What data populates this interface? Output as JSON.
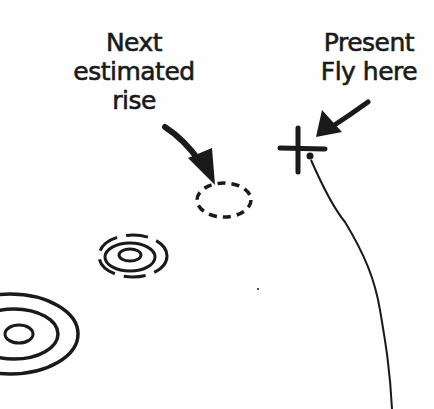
{
  "diagram": {
    "labels": {
      "next_rise": {
        "lines": [
          "Next",
          "estimated",
          "rise"
        ]
      },
      "present_fly": {
        "lines": [
          "Present",
          "Fly here"
        ]
      }
    },
    "elements": {
      "present_fly_marker": "cross-mark",
      "next_rise_marker": "dashed-oval",
      "drift_line": "curved-line",
      "rise_rings": [
        "small-rise-rings",
        "large-rise-rings"
      ]
    },
    "colors": {
      "ink": "#1a1a1a",
      "background": "#fefefe"
    }
  }
}
